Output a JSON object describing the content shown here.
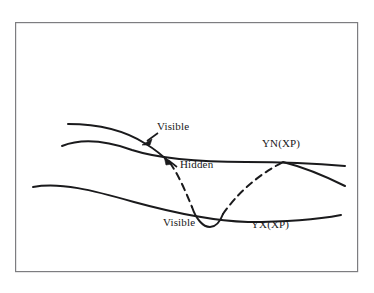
{
  "figure": {
    "type": "line-diagram",
    "background_color": "#ffffff",
    "stroke_color": "#1a1a1c",
    "frame": {
      "name": "diagram-border",
      "x": 15,
      "y": 22,
      "width": 343,
      "height": 250,
      "stroke_color": "#7d7d80",
      "stroke_width": 1.2,
      "fill": "none"
    },
    "labels": [
      {
        "id": "visible-upper",
        "text": "Visible",
        "x": 157,
        "y": 126,
        "has_arrow": true,
        "arrow_from": [
          157,
          134
        ],
        "arrow_to": [
          144,
          143
        ]
      },
      {
        "id": "hidden",
        "text": "Hidden",
        "x": 176,
        "y": 164,
        "has_arrow": true,
        "arrow_from": [
          176,
          167
        ],
        "arrow_to": [
          166,
          159
        ]
      },
      {
        "id": "yn-xp",
        "text": "YN(XP)",
        "x": 262,
        "y": 143,
        "has_arrow": false
      },
      {
        "id": "visible-lower",
        "text": "Visible",
        "x": 163,
        "y": 222,
        "has_arrow": false
      },
      {
        "id": "yx-xp",
        "text": "YX(XP)",
        "x": 250,
        "y": 224,
        "has_arrow": false
      }
    ],
    "curves": [
      {
        "id": "profile-visible-upper",
        "name": "profile-curve-visible-upper-segment",
        "style": "solid",
        "stroke_width": 2.0,
        "path": "M 68 124 C 98 124 126 131 146 144 C 156 150 163 156 170 163"
      },
      {
        "id": "profile-hidden",
        "name": "profile-curve-hidden-segment",
        "style": "dashed",
        "stroke_width": 2.0,
        "dash": "7 5",
        "path": "M 170 163 C 178 174 185 190 192 207"
      },
      {
        "id": "profile-visible-dip",
        "name": "profile-curve-visible-dip-segment",
        "style": "solid",
        "stroke_width": 2.0,
        "path": "M 192 207 C 196 219 203 227 210 227 C 216 227 220 222 223 214"
      },
      {
        "id": "profile-hidden-rise",
        "name": "profile-curve-hidden-rising-segment",
        "style": "dashed",
        "stroke_width": 2.0,
        "dash": "7 5",
        "path": "M 223 214 C 236 195 256 176 283 162"
      },
      {
        "id": "profile-visible-right",
        "name": "profile-curve-visible-right-segment",
        "style": "solid",
        "stroke_width": 2.0,
        "path": "M 283 162 C 303 167 325 176 345 186"
      },
      {
        "id": "yn-curve",
        "name": "yn-xp-curve",
        "style": "solid",
        "stroke_width": 2.0,
        "path": "M 62 146 C 80 139 104 140 132 150 C 160 159 198 162 246 162 C 290 162 322 164 345 166"
      },
      {
        "id": "yx-curve",
        "name": "yx-xp-curve",
        "style": "solid",
        "stroke_width": 2.0,
        "path": "M 33 187 C 60 182 92 190 134 202 C 178 214 214 221 248 222 C 290 222 320 219 341 215"
      }
    ]
  }
}
